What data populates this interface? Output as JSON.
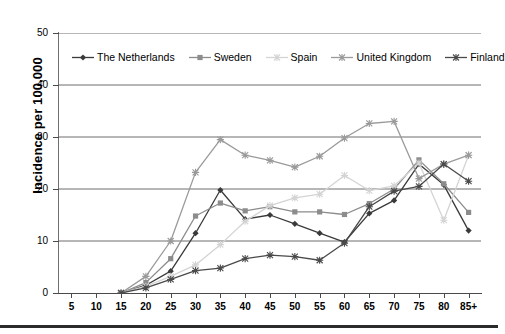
{
  "chart_data": {
    "type": "line",
    "title": "",
    "xlabel": "",
    "ylabel": "Incidence per 100,000",
    "categories": [
      "5",
      "10",
      "15",
      "20",
      "25",
      "30",
      "35",
      "40",
      "45",
      "50",
      "55",
      "60",
      "65",
      "70",
      "75",
      "80",
      "85+"
    ],
    "ylim": [
      0,
      50
    ],
    "yticks": [
      0,
      10,
      20,
      30,
      40,
      50
    ],
    "grid": "horizontal",
    "legend_position": "inside-top",
    "series": [
      {
        "name": "The Netherlands",
        "color": "#3a3a3a",
        "marker": "diamond",
        "values": [
          null,
          null,
          0,
          1.5,
          4.2,
          11.5,
          19.8,
          14.2,
          15.0,
          13.3,
          11.5,
          9.8,
          15.3,
          17.8,
          24.8,
          20.8,
          12.0
        ]
      },
      {
        "name": "Sweden",
        "color": "#8c8c8c",
        "marker": "square",
        "values": [
          null,
          null,
          0,
          2.0,
          6.6,
          14.8,
          17.3,
          15.8,
          16.6,
          15.6,
          15.6,
          15.1,
          17.2,
          20.0,
          25.6,
          21.0,
          15.5
        ]
      },
      {
        "name": "Spain",
        "color": "#d4d4d4",
        "marker": "cross",
        "values": [
          null,
          null,
          0,
          1.3,
          3.2,
          5.4,
          9.3,
          13.8,
          16.8,
          18.3,
          19.0,
          22.6,
          19.7,
          20.6,
          25.0,
          14.0,
          26.5
        ]
      },
      {
        "name": "United Kingdom",
        "color": "#9a9a9a",
        "marker": "cross",
        "values": [
          null,
          null,
          0,
          3.2,
          10.0,
          23.2,
          29.5,
          26.5,
          25.5,
          24.2,
          26.3,
          29.8,
          32.6,
          33.0,
          22.0,
          24.8,
          26.5
        ]
      },
      {
        "name": "Finland",
        "color": "#4a4a4a",
        "marker": "cross",
        "values": [
          null,
          null,
          0,
          1.0,
          2.6,
          4.3,
          4.8,
          6.6,
          7.3,
          7.0,
          6.3,
          9.6,
          16.6,
          19.6,
          20.5,
          24.8,
          21.5
        ]
      }
    ]
  }
}
